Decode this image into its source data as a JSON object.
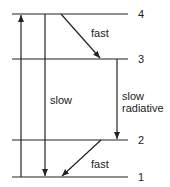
{
  "diagram": {
    "type": "energy-level-diagram",
    "levels": [
      {
        "label": "4"
      },
      {
        "label": "3"
      },
      {
        "label": "2"
      },
      {
        "label": "1"
      }
    ],
    "transitions": [
      {
        "from": "1",
        "to": "4",
        "label": ""
      },
      {
        "from": "4",
        "to": "3",
        "label": "fast"
      },
      {
        "from": "4",
        "to": "1",
        "label": "slow"
      },
      {
        "from": "3",
        "to": "2",
        "label_line1": "slow",
        "label_line2": "radiative"
      },
      {
        "from": "2",
        "to": "1",
        "label": "fast"
      }
    ]
  }
}
